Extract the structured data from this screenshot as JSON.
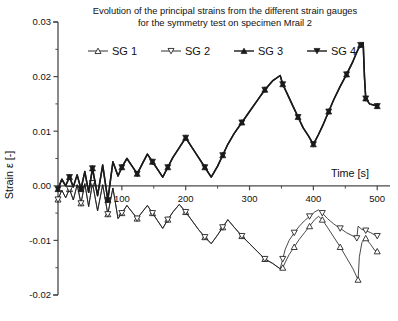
{
  "chart_data": {
    "type": "line",
    "title_line1": "Evolution of the principal strains from the different strain gauges",
    "title_line2": "for the symmetry test on specimen Mrail 2",
    "xlabel": "Time [s]",
    "ylabel": "Strain ε [-]",
    "xlim": [
      0,
      520
    ],
    "ylim": [
      -0.02,
      0.03
    ],
    "xticks": [
      0,
      100,
      200,
      300,
      400,
      500
    ],
    "xtick_labels": [
      "0",
      "100",
      "200",
      "300",
      "400",
      "500"
    ],
    "xminor_step": 50,
    "yticks": [
      -0.02,
      -0.01,
      0.0,
      0.01,
      0.02,
      0.03
    ],
    "ytick_labels": [
      "-0.02",
      "-0.01",
      "0.00",
      "0.01",
      "0.02",
      "0.03"
    ],
    "yminor_step": 0.005,
    "grid": false,
    "legend_position": "top-center",
    "legend": [
      "SG 1",
      "SG 2",
      "SG 3",
      "SG 4"
    ],
    "markers": [
      "triangle-up-open",
      "triangle-down-open",
      "triangle-up-filled",
      "triangle-down-filled"
    ],
    "line_color": "#1a1a1a",
    "series": [
      {
        "name": "SG 1",
        "marker": "triangle-up-open",
        "fill": "#ffffff",
        "x": [
          0,
          6,
          12,
          18,
          24,
          30,
          36,
          42,
          48,
          54,
          62,
          70,
          78,
          86,
          94,
          100,
          108,
          116,
          124,
          132,
          140,
          148,
          156,
          164,
          172,
          180,
          190,
          200,
          210,
          220,
          230,
          240,
          250,
          258,
          266,
          276,
          288,
          300,
          312,
          324,
          336,
          348,
          352,
          356,
          362,
          370,
          378,
          386,
          394,
          402,
          408,
          414,
          422,
          432,
          442,
          452,
          462,
          470,
          472,
          476,
          482,
          490,
          496,
          500
        ],
        "y": [
          -0.0025,
          -0.0008,
          -0.0022,
          -0.0006,
          -0.0026,
          0.0002,
          -0.0032,
          0.0004,
          -0.0038,
          0.0005,
          -0.0046,
          0.0002,
          -0.0052,
          -0.0004,
          -0.006,
          -0.005,
          -0.0036,
          -0.0048,
          -0.006,
          -0.0048,
          -0.0036,
          -0.005,
          -0.0064,
          -0.0078,
          -0.0062,
          -0.0048,
          -0.0034,
          -0.0048,
          -0.0064,
          -0.008,
          -0.0094,
          -0.0106,
          -0.009,
          -0.0076,
          -0.0062,
          -0.0076,
          -0.0092,
          -0.0106,
          -0.012,
          -0.0134,
          -0.0142,
          -0.0152,
          -0.015,
          -0.014,
          -0.0126,
          -0.0112,
          -0.0098,
          -0.0086,
          -0.0074,
          -0.0062,
          -0.0056,
          -0.0062,
          -0.0076,
          -0.0094,
          -0.0112,
          -0.0132,
          -0.0152,
          -0.0172,
          -0.013,
          -0.0104,
          -0.0096,
          -0.0108,
          -0.0118,
          -0.012
        ]
      },
      {
        "name": "SG 2",
        "marker": "triangle-down-open",
        "fill": "#ffffff",
        "x": [
          0,
          6,
          12,
          18,
          24,
          30,
          36,
          42,
          48,
          54,
          62,
          70,
          78,
          86,
          94,
          100,
          108,
          116,
          124,
          132,
          140,
          148,
          156,
          164,
          172,
          180,
          190,
          200,
          210,
          220,
          230,
          240,
          250,
          258,
          266,
          276,
          288,
          300,
          312,
          324,
          336,
          348,
          352,
          356,
          362,
          370,
          378,
          386,
          394,
          402,
          408,
          414,
          422,
          432,
          442,
          452,
          462,
          468,
          470,
          476,
          482,
          490,
          496,
          500
        ],
        "y": [
          -0.0025,
          -0.0008,
          -0.0022,
          -0.0006,
          -0.0026,
          0.0002,
          -0.0032,
          0.0004,
          -0.0038,
          0.0005,
          -0.0046,
          0.0002,
          -0.0052,
          -0.0004,
          -0.006,
          -0.005,
          -0.0036,
          -0.0048,
          -0.006,
          -0.0048,
          -0.0036,
          -0.005,
          -0.0064,
          -0.0078,
          -0.0062,
          -0.0048,
          -0.0034,
          -0.0048,
          -0.0064,
          -0.008,
          -0.0094,
          -0.0106,
          -0.009,
          -0.0076,
          -0.0062,
          -0.0076,
          -0.0092,
          -0.0106,
          -0.012,
          -0.0134,
          -0.0142,
          -0.0152,
          -0.0134,
          -0.0116,
          -0.01,
          -0.0086,
          -0.0074,
          -0.0064,
          -0.0056,
          -0.0048,
          -0.0044,
          -0.005,
          -0.006,
          -0.007,
          -0.0078,
          -0.0086,
          -0.0092,
          -0.0096,
          -0.0074,
          -0.008,
          -0.0082,
          -0.0086,
          -0.009,
          -0.0092
        ]
      },
      {
        "name": "SG 3",
        "marker": "triangle-up-filled",
        "fill": "#1a1a1a",
        "x": [
          0,
          6,
          12,
          18,
          24,
          30,
          36,
          42,
          48,
          54,
          62,
          70,
          78,
          86,
          94,
          100,
          108,
          116,
          124,
          132,
          140,
          148,
          156,
          164,
          172,
          180,
          190,
          200,
          210,
          220,
          230,
          240,
          250,
          258,
          266,
          276,
          288,
          300,
          312,
          324,
          336,
          348,
          352,
          360,
          368,
          376,
          384,
          392,
          400,
          408,
          416,
          424,
          432,
          442,
          452,
          462,
          470,
          474,
          478,
          480,
          482,
          488,
          494,
          500
        ],
        "y": [
          -0.0006,
          0.0012,
          0.0,
          0.0016,
          -0.0002,
          0.002,
          -0.0006,
          0.0026,
          -0.0012,
          0.0032,
          -0.0018,
          0.0038,
          -0.0026,
          0.0044,
          0.0018,
          0.0034,
          0.005,
          0.0036,
          0.0022,
          0.004,
          0.0058,
          0.0044,
          0.003,
          0.0016,
          0.0034,
          0.0052,
          0.007,
          0.0088,
          0.007,
          0.0052,
          0.0034,
          0.0016,
          0.0036,
          0.0056,
          0.0076,
          0.0096,
          0.0116,
          0.0136,
          0.0156,
          0.0176,
          0.0192,
          0.0202,
          0.0186,
          0.0166,
          0.0146,
          0.0126,
          0.0106,
          0.0092,
          0.0076,
          0.0094,
          0.0114,
          0.0136,
          0.0158,
          0.0182,
          0.0204,
          0.0228,
          0.025,
          0.0258,
          0.0262,
          0.02,
          0.016,
          0.015,
          0.0148,
          0.0146
        ]
      },
      {
        "name": "SG 4",
        "marker": "triangle-down-filled",
        "fill": "#1a1a1a",
        "x": [
          0,
          6,
          12,
          18,
          24,
          30,
          36,
          42,
          48,
          54,
          62,
          70,
          78,
          86,
          94,
          100,
          108,
          116,
          124,
          132,
          140,
          148,
          156,
          164,
          172,
          180,
          190,
          200,
          210,
          220,
          230,
          240,
          250,
          258,
          266,
          276,
          288,
          300,
          312,
          324,
          336,
          348,
          352,
          360,
          368,
          376,
          384,
          392,
          400,
          408,
          416,
          424,
          432,
          442,
          452,
          462,
          470,
          474,
          478,
          480,
          482,
          488,
          494,
          500
        ],
        "y": [
          -0.0006,
          0.0012,
          0.0,
          0.0016,
          -0.0002,
          0.002,
          -0.0006,
          0.0026,
          -0.0012,
          0.0032,
          -0.0018,
          0.0038,
          -0.0026,
          0.0044,
          0.0018,
          0.0034,
          0.005,
          0.0036,
          0.0022,
          0.004,
          0.0058,
          0.0044,
          0.003,
          0.0016,
          0.0034,
          0.0052,
          0.007,
          0.0088,
          0.007,
          0.0052,
          0.0034,
          0.0016,
          0.0036,
          0.0056,
          0.0076,
          0.0096,
          0.0116,
          0.0136,
          0.0156,
          0.0176,
          0.0192,
          0.0202,
          0.0186,
          0.0166,
          0.0146,
          0.0126,
          0.0106,
          0.0092,
          0.0076,
          0.0094,
          0.0114,
          0.0136,
          0.0158,
          0.0182,
          0.0204,
          0.0228,
          0.025,
          0.0258,
          0.0262,
          0.02,
          0.016,
          0.015,
          0.0148,
          0.0146
        ]
      }
    ]
  }
}
